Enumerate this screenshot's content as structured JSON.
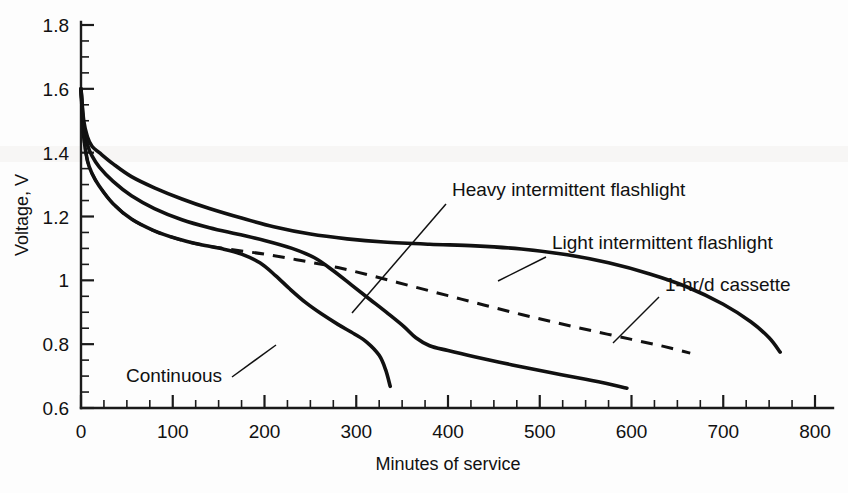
{
  "chart_data": {
    "type": "line",
    "title": "",
    "xlabel": "Minutes of service",
    "ylabel": "Voltage, V",
    "xlim": [
      0,
      800
    ],
    "ylim": [
      0.6,
      1.8
    ],
    "grid": false,
    "legend_position": "inline-annotations",
    "x_ticks": [
      0,
      100,
      200,
      300,
      400,
      500,
      600,
      700,
      800
    ],
    "x_tick_labels": [
      "0",
      "100",
      "200",
      "300",
      "400",
      "500",
      "600",
      "700",
      "800"
    ],
    "x_minor_tick_interval": 25,
    "y_ticks": [
      0.6,
      0.8,
      1,
      1.2,
      1.4,
      1.6,
      1.8
    ],
    "y_tick_labels": [
      "0.6",
      "0.8",
      "1",
      "1.2",
      "1.4",
      "1.6",
      "1.8"
    ],
    "y_minor_tick_interval": 0.05,
    "series": [
      {
        "name": "Light intermittent flashlight",
        "style": "solid",
        "points": [
          [
            0,
            1.6
          ],
          [
            3,
            1.5
          ],
          [
            7,
            1.45
          ],
          [
            12,
            1.42
          ],
          [
            20,
            1.4
          ],
          [
            35,
            1.365
          ],
          [
            55,
            1.325
          ],
          [
            80,
            1.29
          ],
          [
            110,
            1.255
          ],
          [
            140,
            1.225
          ],
          [
            175,
            1.195
          ],
          [
            210,
            1.168
          ],
          [
            250,
            1.145
          ],
          [
            290,
            1.13
          ],
          [
            330,
            1.12
          ],
          [
            380,
            1.113
          ],
          [
            430,
            1.108
          ],
          [
            480,
            1.098
          ],
          [
            530,
            1.08
          ],
          [
            575,
            1.055
          ],
          [
            620,
            1.02
          ],
          [
            660,
            0.98
          ],
          [
            700,
            0.925
          ],
          [
            730,
            0.87
          ],
          [
            750,
            0.82
          ],
          [
            762,
            0.775
          ]
        ]
      },
      {
        "name": "Heavy intermittent flashlight",
        "style": "solid",
        "points": [
          [
            0,
            1.6
          ],
          [
            3,
            1.48
          ],
          [
            7,
            1.425
          ],
          [
            12,
            1.39
          ],
          [
            20,
            1.355
          ],
          [
            35,
            1.31
          ],
          [
            55,
            1.265
          ],
          [
            80,
            1.225
          ],
          [
            110,
            1.19
          ],
          [
            140,
            1.165
          ],
          [
            170,
            1.145
          ],
          [
            200,
            1.125
          ],
          [
            230,
            1.1
          ],
          [
            255,
            1.07
          ],
          [
            275,
            1.03
          ],
          [
            295,
            0.985
          ],
          [
            315,
            0.94
          ],
          [
            335,
            0.895
          ],
          [
            352,
            0.855
          ],
          [
            365,
            0.82
          ],
          [
            380,
            0.795
          ],
          [
            400,
            0.78
          ],
          [
            430,
            0.76
          ],
          [
            470,
            0.735
          ],
          [
            510,
            0.712
          ],
          [
            550,
            0.69
          ],
          [
            580,
            0.672
          ],
          [
            595,
            0.662
          ]
        ]
      },
      {
        "name": "Continuous",
        "style": "solid",
        "points": [
          [
            0,
            1.6
          ],
          [
            3,
            1.45
          ],
          [
            7,
            1.375
          ],
          [
            12,
            1.335
          ],
          [
            20,
            1.295
          ],
          [
            35,
            1.24
          ],
          [
            55,
            1.192
          ],
          [
            80,
            1.155
          ],
          [
            105,
            1.13
          ],
          [
            130,
            1.112
          ],
          [
            155,
            1.098
          ],
          [
            175,
            1.082
          ],
          [
            195,
            1.055
          ],
          [
            212,
            1.015
          ],
          [
            228,
            0.972
          ],
          [
            245,
            0.93
          ],
          [
            262,
            0.895
          ],
          [
            280,
            0.862
          ],
          [
            298,
            0.832
          ],
          [
            312,
            0.805
          ],
          [
            325,
            0.765
          ],
          [
            332,
            0.72
          ],
          [
            337,
            0.668
          ]
        ]
      },
      {
        "name": "1-hr/d cassette",
        "style": "dashed",
        "points": [
          [
            0,
            1.6
          ],
          [
            3,
            1.45
          ],
          [
            7,
            1.375
          ],
          [
            12,
            1.335
          ],
          [
            20,
            1.295
          ],
          [
            35,
            1.24
          ],
          [
            55,
            1.192
          ],
          [
            80,
            1.155
          ],
          [
            105,
            1.13
          ],
          [
            130,
            1.112
          ],
          [
            160,
            1.098
          ],
          [
            200,
            1.082
          ],
          [
            240,
            1.062
          ],
          [
            280,
            1.04
          ],
          [
            320,
            1.012
          ],
          [
            360,
            0.982
          ],
          [
            400,
            0.952
          ],
          [
            440,
            0.922
          ],
          [
            480,
            0.893
          ],
          [
            520,
            0.866
          ],
          [
            560,
            0.84
          ],
          [
            600,
            0.815
          ],
          [
            635,
            0.793
          ],
          [
            664,
            0.772
          ]
        ]
      }
    ],
    "annotations": [
      {
        "text": "Heavy intermittent flashlight",
        "label_x": 452,
        "label_y": 196,
        "leader_from": [
          446,
          204
        ],
        "leader_to": [
          352,
          313
        ]
      },
      {
        "text": "Light intermittent flashlight",
        "label_x": 552,
        "label_y": 249,
        "leader_from": [
          546,
          257
        ],
        "leader_to": [
          498,
          281
        ]
      },
      {
        "text": "1-hr/d cassette",
        "label_x": 665,
        "label_y": 291,
        "leader_from": [
          659,
          297
        ],
        "leader_to": [
          613,
          343
        ]
      },
      {
        "text": "Continuous",
        "label_x": 126,
        "label_y": 382,
        "leader_from": [
          232,
          377
        ],
        "leader_to": [
          276,
          345
        ]
      }
    ]
  }
}
